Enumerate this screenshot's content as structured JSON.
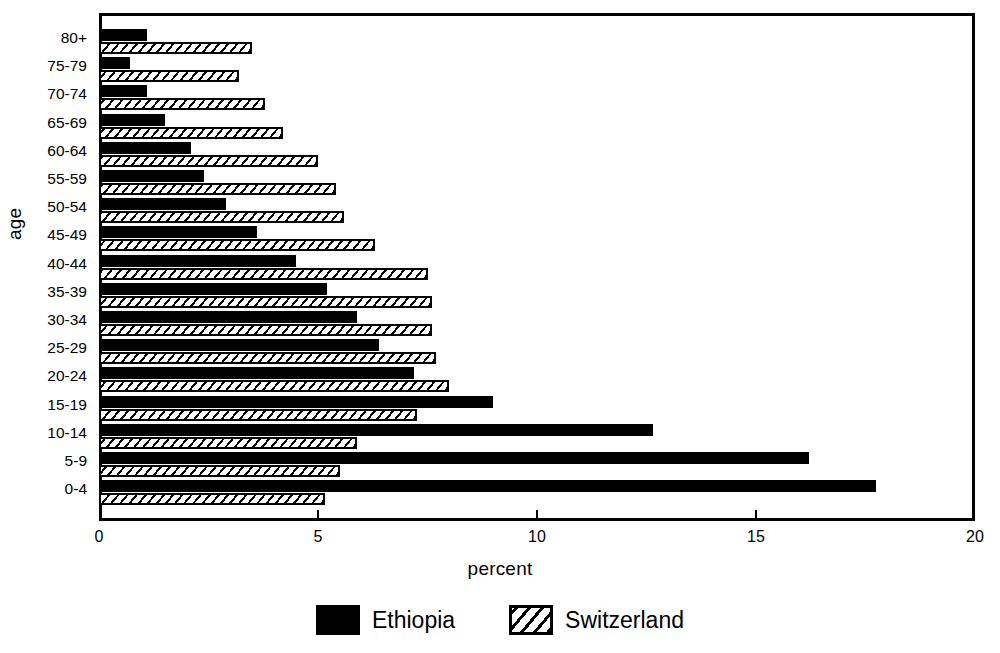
{
  "chart_data": {
    "type": "bar",
    "orientation": "horizontal",
    "title": "",
    "xlabel": "percent",
    "ylabel": "age",
    "xlim": [
      0,
      20
    ],
    "xticks": [
      0,
      5,
      10,
      15,
      20
    ],
    "xtick_labels": [
      "0",
      "5",
      "10",
      "15",
      "20"
    ],
    "grid": false,
    "legend_position": "bottom",
    "categories": [
      "80+",
      "75-79",
      "70-74",
      "65-69",
      "60-64",
      "55-59",
      "50-54",
      "45-49",
      "40-44",
      "35-39",
      "30-34",
      "25-29",
      "20-24",
      "15-19",
      "10-14",
      "5-9",
      "0-4"
    ],
    "series": [
      {
        "name": "Ethiopia",
        "fill": "solid",
        "color": "#000000",
        "values": [
          1.1,
          0.7,
          1.1,
          1.5,
          2.1,
          2.4,
          2.9,
          3.6,
          4.5,
          5.2,
          5.9,
          6.4,
          7.2,
          9.0,
          12.65,
          16.2,
          17.75
        ]
      },
      {
        "name": "Switzerland",
        "fill": "diagonal-hatch",
        "color": "#000000",
        "values": [
          3.5,
          3.2,
          3.8,
          4.2,
          5.0,
          5.4,
          5.6,
          6.3,
          7.5,
          7.6,
          7.6,
          7.7,
          8.0,
          7.25,
          5.9,
          5.5,
          5.15
        ]
      }
    ],
    "legend": [
      "Ethiopia",
      "Switzerland"
    ]
  },
  "axes": {
    "y_title": "age",
    "x_title": "percent"
  }
}
